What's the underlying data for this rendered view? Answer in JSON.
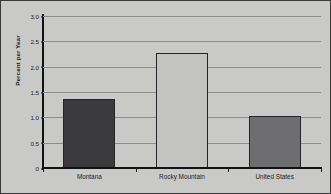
{
  "chart_data": {
    "type": "bar",
    "title": "",
    "subtitle": "",
    "xlabel": "",
    "ylabel": "Percent per Year",
    "categories": [
      "Montana",
      "Rocky Mountain",
      "United States"
    ],
    "values": [
      1.37,
      2.27,
      1.03
    ],
    "series": [
      {
        "name": "Percent per Year",
        "values": [
          1.37,
          2.27,
          1.03
        ]
      }
    ],
    "ylim": [
      0,
      3.0
    ],
    "ytick_labels": [
      "0",
      "0.5",
      "1.0",
      "1.5",
      "2.0",
      "2.5",
      "3.0"
    ],
    "ytick_values": [
      0,
      0.5,
      1.0,
      1.5,
      2.0,
      2.5,
      3.0
    ],
    "grid": "horizontal",
    "legend": "none",
    "bar_colors": [
      "#3b3b3d",
      "#c3c3c1",
      "#6e6e70"
    ],
    "bar_edge_color": "#24242a",
    "gridline_color": "#8c8c8a",
    "axis_color": "#111111",
    "background_color": "#c9c9c7",
    "frame_color": "#3a3a3a",
    "text_color": "#1c1c1c",
    "annotations": []
  }
}
